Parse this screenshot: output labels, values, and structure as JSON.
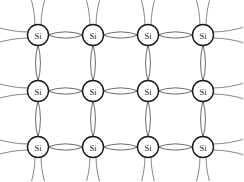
{
  "figure": {
    "background_color": "#ffffff",
    "width": 243,
    "height": 181
  },
  "lattice": {
    "atom_label": "Si",
    "element_symbol": "Si",
    "rows": 3,
    "columns": 4,
    "atom_radius": 10.5,
    "atom_circle_color": "#1a1a1a",
    "atom_fill_color": "#ffffff",
    "atom_label_color": "#1a1a1a",
    "bond_color": "#5a5a5a",
    "dangling_bond_color": "#7a7a7a",
    "column_x": [
      38,
      93,
      148,
      203
    ],
    "row_y": [
      35,
      91,
      147
    ],
    "bond_bulge_horizontal": 6.5,
    "bond_bulge_vertical": 5.0,
    "dangling_length_vertical": 32,
    "dangling_length_horizontal": 34,
    "dangling_spread": 9,
    "atoms": [
      {
        "id": "si-r0-c0",
        "row": 0,
        "col": 0,
        "label": "Si",
        "cx": 38,
        "cy": 35
      },
      {
        "id": "si-r0-c1",
        "row": 0,
        "col": 1,
        "label": "Si",
        "cx": 93,
        "cy": 35
      },
      {
        "id": "si-r0-c2",
        "row": 0,
        "col": 2,
        "label": "Si",
        "cx": 148,
        "cy": 35
      },
      {
        "id": "si-r0-c3",
        "row": 0,
        "col": 3,
        "label": "Si",
        "cx": 203,
        "cy": 35
      },
      {
        "id": "si-r1-c0",
        "row": 1,
        "col": 0,
        "label": "Si",
        "cx": 38,
        "cy": 91
      },
      {
        "id": "si-r1-c1",
        "row": 1,
        "col": 1,
        "label": "Si",
        "cx": 93,
        "cy": 91
      },
      {
        "id": "si-r1-c2",
        "row": 1,
        "col": 2,
        "label": "Si",
        "cx": 148,
        "cy": 91
      },
      {
        "id": "si-r1-c3",
        "row": 1,
        "col": 3,
        "label": "Si",
        "cx": 203,
        "cy": 91
      },
      {
        "id": "si-r2-c0",
        "row": 2,
        "col": 0,
        "label": "Si",
        "cx": 38,
        "cy": 147
      },
      {
        "id": "si-r2-c1",
        "row": 2,
        "col": 1,
        "label": "Si",
        "cx": 93,
        "cy": 147
      },
      {
        "id": "si-r2-c2",
        "row": 2,
        "col": 2,
        "label": "Si",
        "cx": 148,
        "cy": 147
      },
      {
        "id": "si-r2-c3",
        "row": 2,
        "col": 3,
        "label": "Si",
        "cx": 203,
        "cy": 147
      }
    ],
    "bonds_horizontal": [
      {
        "id": "bond-h-r0-c0",
        "from": "si-r0-c0",
        "to": "si-r0-c1"
      },
      {
        "id": "bond-h-r0-c1",
        "from": "si-r0-c1",
        "to": "si-r0-c2"
      },
      {
        "id": "bond-h-r0-c2",
        "from": "si-r0-c2",
        "to": "si-r0-c3"
      },
      {
        "id": "bond-h-r1-c0",
        "from": "si-r1-c0",
        "to": "si-r1-c1"
      },
      {
        "id": "bond-h-r1-c1",
        "from": "si-r1-c1",
        "to": "si-r1-c2"
      },
      {
        "id": "bond-h-r1-c2",
        "from": "si-r1-c2",
        "to": "si-r1-c3"
      },
      {
        "id": "bond-h-r2-c0",
        "from": "si-r2-c0",
        "to": "si-r2-c1"
      },
      {
        "id": "bond-h-r2-c1",
        "from": "si-r2-c1",
        "to": "si-r2-c2"
      },
      {
        "id": "bond-h-r2-c2",
        "from": "si-r2-c2",
        "to": "si-r2-c3"
      }
    ],
    "bonds_vertical": [
      {
        "id": "bond-v-c0-r0",
        "from": "si-r0-c0",
        "to": "si-r1-c0"
      },
      {
        "id": "bond-v-c0-r1",
        "from": "si-r1-c0",
        "to": "si-r2-c0"
      },
      {
        "id": "bond-v-c1-r0",
        "from": "si-r0-c1",
        "to": "si-r1-c1"
      },
      {
        "id": "bond-v-c1-r1",
        "from": "si-r1-c1",
        "to": "si-r2-c1"
      },
      {
        "id": "bond-v-c2-r0",
        "from": "si-r0-c2",
        "to": "si-r1-c2"
      },
      {
        "id": "bond-v-c2-r1",
        "from": "si-r1-c2",
        "to": "si-r2-c2"
      },
      {
        "id": "bond-v-c3-r0",
        "from": "si-r0-c3",
        "to": "si-r1-c3"
      },
      {
        "id": "bond-v-c3-r1",
        "from": "si-r1-c3",
        "to": "si-r2-c3"
      }
    ],
    "dangling_bonds": [
      {
        "id": "dangle-up-c0",
        "atom": "si-r0-c0",
        "direction": "up"
      },
      {
        "id": "dangle-up-c1",
        "atom": "si-r0-c1",
        "direction": "up"
      },
      {
        "id": "dangle-up-c2",
        "atom": "si-r0-c2",
        "direction": "up"
      },
      {
        "id": "dangle-up-c3",
        "atom": "si-r0-c3",
        "direction": "up"
      },
      {
        "id": "dangle-down-c0",
        "atom": "si-r2-c0",
        "direction": "down"
      },
      {
        "id": "dangle-down-c1",
        "atom": "si-r2-c1",
        "direction": "down"
      },
      {
        "id": "dangle-down-c2",
        "atom": "si-r2-c2",
        "direction": "down"
      },
      {
        "id": "dangle-down-c3",
        "atom": "si-r2-c3",
        "direction": "down"
      },
      {
        "id": "dangle-left-r0",
        "atom": "si-r0-c0",
        "direction": "left"
      },
      {
        "id": "dangle-left-r1",
        "atom": "si-r1-c0",
        "direction": "left"
      },
      {
        "id": "dangle-left-r2",
        "atom": "si-r2-c0",
        "direction": "left"
      },
      {
        "id": "dangle-right-r0",
        "atom": "si-r0-c3",
        "direction": "right"
      },
      {
        "id": "dangle-right-r1",
        "atom": "si-r1-c3",
        "direction": "right"
      },
      {
        "id": "dangle-right-r2",
        "atom": "si-r2-c3",
        "direction": "right"
      }
    ]
  }
}
